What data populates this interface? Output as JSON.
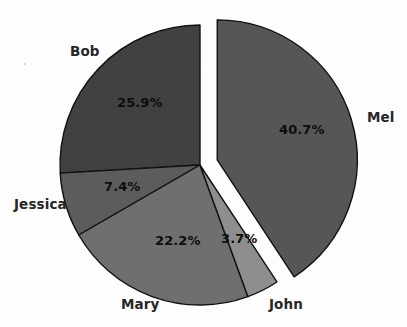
{
  "chart_data": {
    "type": "pie",
    "title": "",
    "subtitle": "",
    "xlabel": "",
    "ylabel": "",
    "legend_position": "none",
    "grid": false,
    "labels_inside": "percent",
    "labels_outside": "category",
    "start_angle_deg": 0,
    "direction": "clockwise",
    "categories": [
      "Mel",
      "John",
      "Mary",
      "Jessica",
      "Bob"
    ],
    "values": [
      40.7,
      3.7,
      22.2,
      7.4,
      25.9
    ],
    "value_labels": [
      "40.7%",
      "3.7%",
      "22.2%",
      "7.4%",
      "25.9%"
    ],
    "colors": [
      "#565656",
      "#8e8e8e",
      "#6f6f6f",
      "#5c5c5c",
      "#414141"
    ],
    "exploded": [
      "Mel"
    ],
    "slices": [
      {
        "name": "Mel",
        "category_label": "Mel",
        "percent_label": "40.7%",
        "value": 40.7,
        "color": "#565656",
        "exploded": true
      },
      {
        "name": "John",
        "category_label": "John",
        "percent_label": "3.7%",
        "value": 3.7,
        "color": "#8e8e8e",
        "exploded": false
      },
      {
        "name": "Mary",
        "category_label": "Mary",
        "percent_label": "22.2%",
        "value": 22.2,
        "color": "#6f6f6f",
        "exploded": false
      },
      {
        "name": "Jessica",
        "category_label": "Jessica",
        "percent_label": "7.4%",
        "value": 7.4,
        "color": "#5c5c5c",
        "exploded": false
      },
      {
        "name": "Bob",
        "category_label": "Bob",
        "percent_label": "25.9%",
        "value": 25.9,
        "color": "#414141",
        "exploded": false
      }
    ]
  },
  "labels": {
    "bob": "Bob",
    "mel": "Mel",
    "jessica": "Jessica",
    "mary": "Mary",
    "john": "John"
  },
  "percents": {
    "bob": "25.9%",
    "mel": "40.7%",
    "jessica": "7.4%",
    "mary": "22.2%",
    "john": "3.7%"
  },
  "style": {
    "background": "#fdfdfd",
    "outline": "#111111",
    "text": "#262626"
  }
}
